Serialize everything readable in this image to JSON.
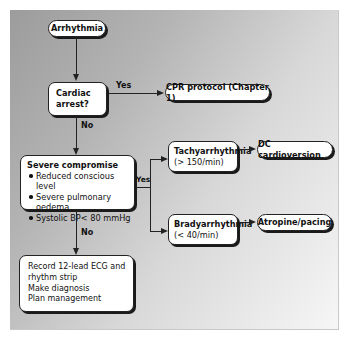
{
  "diagram": {
    "type": "flowchart",
    "nodes": {
      "arrhythmia": {
        "label": "Arrhythmia"
      },
      "cardiac_arrest": {
        "line1": "Cardiac",
        "line2": "arrest?"
      },
      "cpr": {
        "label": "CPR protocol (Chapter 1)"
      },
      "severe": {
        "title": "Severe compromise",
        "bullets": [
          "Reduced conscious level",
          "Severe pulmonary oedema",
          "Systolic BP< 80 mmHg"
        ]
      },
      "tachy": {
        "title": "Tachyarrhythmia",
        "sub": "(> 150/min)"
      },
      "dc": {
        "label": "DC cardioversion"
      },
      "brady": {
        "title": "Bradyarrhythmia",
        "sub": "(< 40/min)"
      },
      "atropine": {
        "label": "Atropine/pacing"
      },
      "record": {
        "lines": [
          "Record 12-lead ECG and",
          "rhythm strip",
          "Make diagnosis",
          "Plan management"
        ]
      }
    },
    "edge_labels": {
      "arrest_yes": "Yes",
      "arrest_no": "No",
      "severe_yes": "Yes",
      "severe_no": "No"
    },
    "edges": [
      [
        "Arrhythmia",
        "Cardiac arrest?"
      ],
      [
        "Cardiac arrest?",
        "CPR protocol (Chapter 1)",
        "Yes"
      ],
      [
        "Cardiac arrest?",
        "Severe compromise",
        "No"
      ],
      [
        "Severe compromise",
        "Tachyarrhythmia",
        "Yes"
      ],
      [
        "Severe compromise",
        "Bradyarrhythmia",
        "Yes"
      ],
      [
        "Severe compromise",
        "Record 12-lead ECG and rhythm strip / Make diagnosis / Plan management",
        "No"
      ],
      [
        "Tachyarrhythmia",
        "DC cardioversion"
      ],
      [
        "Bradyarrhythmia",
        "Atropine/pacing"
      ]
    ]
  }
}
